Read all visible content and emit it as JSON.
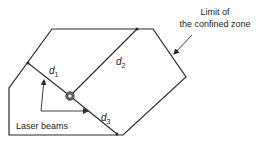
{
  "diagram": {
    "title_label_line1": "Limit of",
    "title_label_line2": "the confined zone",
    "distance_labels": {
      "d1": "d",
      "d1_sub": "1",
      "d2": "d",
      "d2_sub": "2",
      "d3": "d",
      "d3_sub": "3"
    },
    "beams_label": "Laser beams",
    "colors": {
      "stroke": "#2a2a2a",
      "text": "#222222",
      "background": "#ffffff",
      "source": "#555555"
    }
  }
}
